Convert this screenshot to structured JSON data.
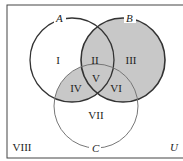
{
  "diagram": {
    "type": "venn-3-set",
    "universe_label": "U",
    "sets": [
      {
        "label": "A",
        "cx": 72,
        "cy": 60,
        "r": 42
      },
      {
        "label": "B",
        "cx": 123,
        "cy": 60,
        "r": 42
      },
      {
        "label": "C",
        "cx": 96,
        "cy": 106,
        "r": 42
      }
    ],
    "regions": [
      {
        "id": "I",
        "label": "I",
        "x": 58,
        "y": 64,
        "shaded": false
      },
      {
        "id": "II",
        "label": "II",
        "x": 95,
        "y": 64,
        "shaded": true
      },
      {
        "id": "III",
        "label": "III",
        "x": 131,
        "y": 64,
        "shaded": true
      },
      {
        "id": "IV",
        "label": "IV",
        "x": 76,
        "y": 91,
        "shaded": true
      },
      {
        "id": "V",
        "label": "V",
        "x": 96,
        "y": 82,
        "shaded": true
      },
      {
        "id": "VI",
        "label": "VI",
        "x": 116,
        "y": 91,
        "shaded": true
      },
      {
        "id": "VII",
        "label": "VII",
        "x": 96,
        "y": 118,
        "shaded": false
      },
      {
        "id": "VIII",
        "label": "VIII",
        "x": 20,
        "y": 151,
        "shaded": false
      }
    ],
    "shading_color": "#c8c8c8",
    "line_color": "#333333"
  }
}
